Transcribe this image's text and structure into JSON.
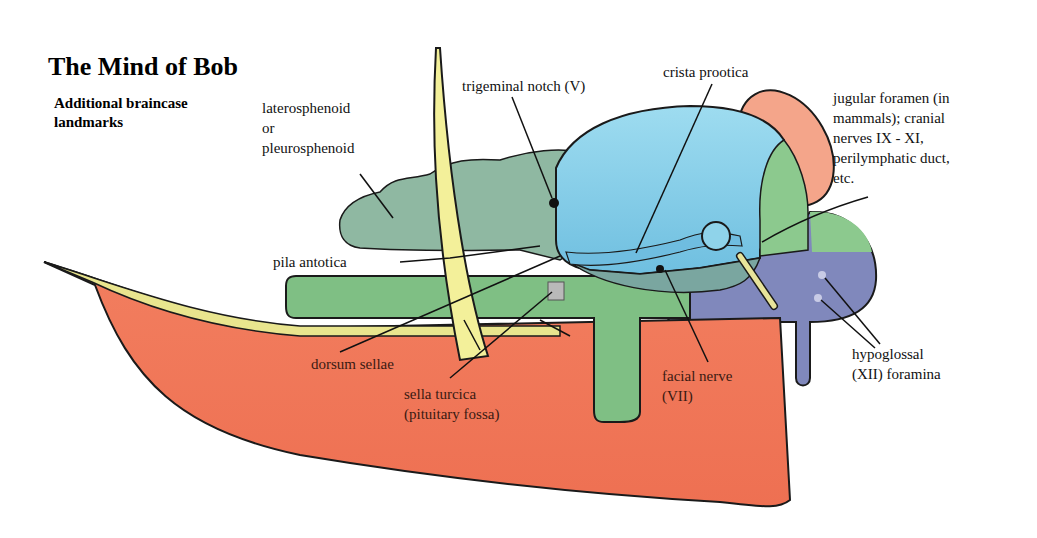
{
  "header": {
    "title": "The Mind of Bob",
    "subtitle": "Additional braincase\nlandmarks"
  },
  "labels": {
    "laterosphenoid": "laterosphenoid\nor\npleurosphenoid",
    "trigeminal_notch": "trigeminal notch (V)",
    "crista_prootica": "crista prootica",
    "jugular_foramen": "jugular foramen (in\nmammals); cranial\nnerves IX - XI,\nperilymphatic duct,\netc.",
    "pila_antotica": "pila antotica",
    "dorsum_sellae": "dorsum sellae",
    "sella_turcica": "sella turcica\n(pituitary fossa)",
    "facial_nerve": "facial nerve\n(VII)",
    "hypoglossal": "hypoglossal\n(XII) foramina"
  },
  "colors": {
    "parasphenoid_red": "#f0795a",
    "basisphenoid_green": "#7fbf84",
    "laterosphenoid_gray_green": "#8fb8a2",
    "epipterygoid_yellow": "#f3f09a",
    "prootic_blue": "#8fd3ea",
    "opisthotic_green": "#8cc98e",
    "supraoccipital_peach": "#f4a58a",
    "exoccipital_purple": "#8088bc",
    "stapes_yellow": "#e8e49a",
    "outline": "#1a1a1a"
  }
}
